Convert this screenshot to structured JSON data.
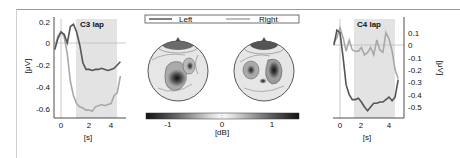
{
  "chart_data": [
    {
      "type": "line",
      "title": "C3 lap",
      "xlabel": "[s]",
      "ylabel": "[μV]",
      "xlim": [
        -0.5,
        4.8
      ],
      "ylim": [
        -0.65,
        0.22
      ],
      "xticks": [
        "0",
        "2",
        "4"
      ],
      "yticks": [
        "0.2",
        "0",
        "-0.2",
        "-0.4",
        "-0.6"
      ],
      "shaded_interval": [
        1.25,
        4.5
      ],
      "grid": false,
      "x": [
        -0.5,
        -0.25,
        0,
        0.25,
        0.5,
        0.75,
        1.0,
        1.25,
        1.5,
        1.75,
        2.0,
        2.25,
        2.5,
        2.75,
        3.0,
        3.25,
        3.5,
        3.75,
        4.0,
        4.25,
        4.5,
        4.75
      ],
      "series": [
        {
          "name": "Left",
          "color": "#555555",
          "values": [
            -0.06,
            0.04,
            0.1,
            0.08,
            0.0,
            0.15,
            0.17,
            0.1,
            -0.02,
            -0.18,
            -0.24,
            -0.24,
            -0.25,
            -0.24,
            -0.24,
            -0.23,
            -0.24,
            -0.25,
            -0.24,
            -0.23,
            -0.2,
            -0.17
          ]
        },
        {
          "name": "Right",
          "color": "#a8a8a8",
          "values": [
            -0.04,
            0.06,
            0.1,
            0.06,
            -0.1,
            -0.35,
            -0.48,
            -0.55,
            -0.58,
            -0.59,
            -0.61,
            -0.61,
            -0.62,
            -0.58,
            -0.57,
            -0.56,
            -0.57,
            -0.56,
            -0.55,
            -0.48,
            -0.45,
            -0.3
          ]
        }
      ]
    },
    {
      "type": "heatmap",
      "title": "Scalp topographies",
      "legend": [
        "Left",
        "Right"
      ],
      "colorbar": {
        "label": "[dB]",
        "ticks": [
          "-1",
          "0",
          "1"
        ],
        "range": [
          -1.5,
          1.5
        ]
      },
      "maps": [
        {
          "name": "Left",
          "features": [
            "strong negative focus centro-parietal right-of-midline",
            "moderate negative focus right-central",
            "dark frontal pole area"
          ]
        },
        {
          "name": "Right",
          "features": [
            "negative focus left-central",
            "negative focus right-central/parietal",
            "small negative focus posterior midline",
            "dark frontal pole area"
          ]
        }
      ]
    },
    {
      "type": "line",
      "title": "C4 lap",
      "xlabel": "[s]",
      "ylabel": "[μV]",
      "xlim": [
        -0.5,
        4.8
      ],
      "ylim": [
        -0.55,
        0.16
      ],
      "xticks": [
        "0",
        "2",
        "4"
      ],
      "yticks": [
        "0.1",
        "0",
        "-0.1",
        "-0.2",
        "-0.3",
        "-0.4",
        "-0.5"
      ],
      "shaded_interval": [
        1.25,
        4.5
      ],
      "grid": false,
      "x": [
        -0.5,
        -0.25,
        0,
        0.25,
        0.5,
        0.75,
        1.0,
        1.25,
        1.5,
        1.75,
        2.0,
        2.25,
        2.5,
        2.75,
        3.0,
        3.25,
        3.5,
        3.75,
        4.0,
        4.25,
        4.5,
        4.75
      ],
      "series": [
        {
          "name": "Left",
          "color": "#555555",
          "values": [
            0.0,
            0.12,
            0.1,
            -0.1,
            -0.32,
            -0.4,
            -0.44,
            -0.44,
            -0.43,
            -0.46,
            -0.5,
            -0.53,
            -0.5,
            -0.47,
            -0.47,
            -0.46,
            -0.46,
            -0.44,
            -0.42,
            -0.45,
            -0.42,
            -0.28
          ]
        },
        {
          "name": "Right",
          "color": "#a8a8a8",
          "values": [
            0.02,
            0.06,
            0.14,
            0.06,
            -0.05,
            0.04,
            -0.04,
            -0.05,
            -0.05,
            -0.02,
            -0.08,
            -0.06,
            -0.02,
            -0.08,
            0.04,
            -0.04,
            -0.06,
            0.1,
            0.05,
            -0.05,
            -0.2,
            -0.27
          ]
        }
      ]
    }
  ],
  "left_panel": {
    "title": "C3 lap",
    "xlabel": "[s]",
    "ylabel": "[μV]",
    "yticks": [
      "0.2",
      "0",
      "-0.2",
      "-0.4",
      "-0.6"
    ],
    "xticks": [
      "0",
      "2",
      "4"
    ]
  },
  "right_panel": {
    "title": "C4 lap",
    "xlabel": "[s]",
    "ylabel": "[μV]",
    "yticks": [
      "0.1",
      "0",
      "-0.1",
      "-0.2",
      "-0.3",
      "-0.4",
      "-0.5"
    ],
    "xticks": [
      "0",
      "2",
      "4"
    ]
  },
  "legend": {
    "left_label": "Left",
    "right_label": "Right"
  },
  "colorbar": {
    "label": "[dB]",
    "ticks": [
      "-1",
      "0",
      "1"
    ]
  },
  "colors": {
    "left_series": "#555555",
    "right_series": "#a8a8a8",
    "shade": "#e3e3e3",
    "axis": "#222222"
  }
}
